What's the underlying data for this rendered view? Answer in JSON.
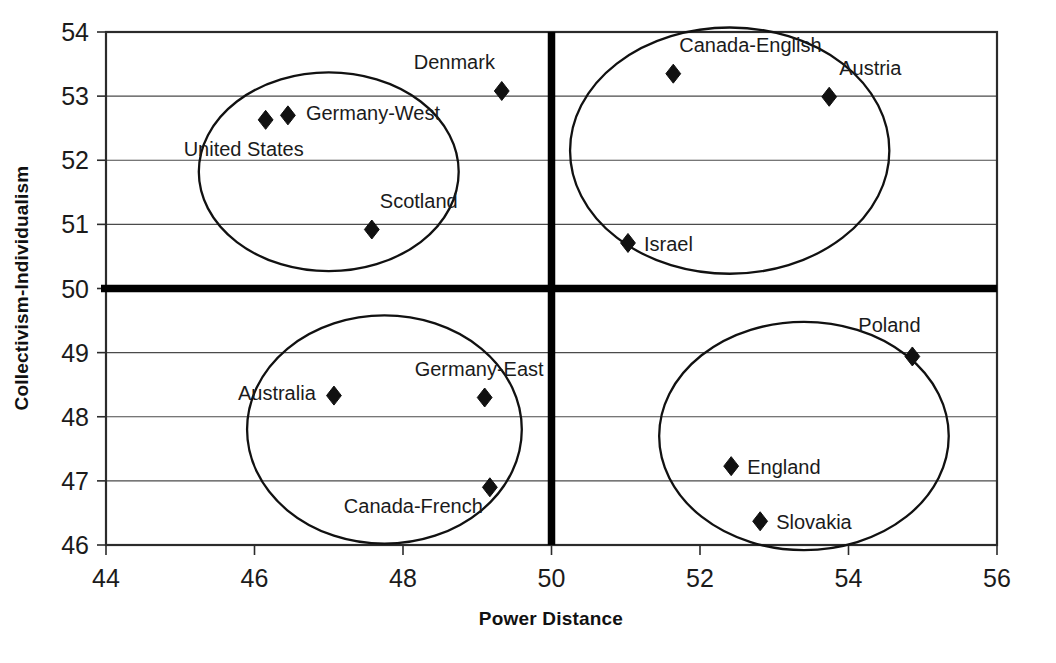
{
  "chart_data": {
    "type": "scatter",
    "title": "",
    "xlabel": "Power Distance",
    "ylabel": "Collectivism-Individualism",
    "xlim": [
      44,
      56
    ],
    "ylim": [
      46,
      54
    ],
    "x_ticks": [
      "44",
      "46",
      "48",
      "50",
      "52",
      "54",
      "56"
    ],
    "y_ticks": [
      "46",
      "47",
      "48",
      "49",
      "50",
      "51",
      "52",
      "53",
      "54"
    ],
    "grid": "horizontal",
    "legend": "none",
    "reference_lines": {
      "vertical_x": 50,
      "horizontal_y": 50,
      "style": "thick-black"
    },
    "points": [
      {
        "label": "United States",
        "x": 46.15,
        "y": 52.63,
        "label_dx": -82,
        "label_dy": 36
      },
      {
        "label": "Germany-West",
        "x": 46.45,
        "y": 52.7,
        "label_dx": 18,
        "label_dy": 5
      },
      {
        "label": "Denmark",
        "x": 49.33,
        "y": 53.08,
        "label_dx": -88,
        "label_dy": -22
      },
      {
        "label": "Scotland",
        "x": 47.58,
        "y": 50.92,
        "label_dx": 8,
        "label_dy": -22
      },
      {
        "label": "Canada-English",
        "x": 51.64,
        "y": 53.35,
        "label_dx": 6,
        "label_dy": -22
      },
      {
        "label": "Austria",
        "x": 53.74,
        "y": 52.99,
        "label_dx": 10,
        "label_dy": -22
      },
      {
        "label": "Israel",
        "x": 51.03,
        "y": 50.71,
        "label_dx": 16,
        "label_dy": 8
      },
      {
        "label": "Australia",
        "x": 47.07,
        "y": 48.33,
        "label_dx": -96,
        "label_dy": 4
      },
      {
        "label": "Germany-East",
        "x": 49.1,
        "y": 48.3,
        "label_dx": -70,
        "label_dy": -22
      },
      {
        "label": "Canada-French",
        "x": 49.17,
        "y": 46.9,
        "label_dx": -146,
        "label_dy": 26
      },
      {
        "label": "Poland",
        "x": 54.86,
        "y": 48.94,
        "label_dx": -54,
        "label_dy": -24
      },
      {
        "label": "England",
        "x": 52.42,
        "y": 47.23,
        "label_dx": 16,
        "label_dy": 8
      },
      {
        "label": "Slovakia",
        "x": 52.81,
        "y": 46.37,
        "label_dx": 16,
        "label_dy": 8
      }
    ],
    "clusters": [
      {
        "name": "individualist-low-power",
        "cx": 47.0,
        "cy": 51.82,
        "rx": 1.75,
        "ry": 1.55
      },
      {
        "name": "individualist-high-power",
        "cx": 52.4,
        "cy": 52.15,
        "rx": 2.15,
        "ry": 1.92
      },
      {
        "name": "collectivist-low-power",
        "cx": 47.75,
        "cy": 47.8,
        "rx": 1.85,
        "ry": 1.78
      },
      {
        "name": "collectivist-high-power",
        "cx": 53.4,
        "cy": 47.7,
        "rx": 1.95,
        "ry": 1.78
      }
    ]
  },
  "colors": {
    "marker": "#111111",
    "grid": "#4a4a4a",
    "frame": "#2b2b2b",
    "axis_thick": "#000000",
    "background": "#ffffff"
  }
}
